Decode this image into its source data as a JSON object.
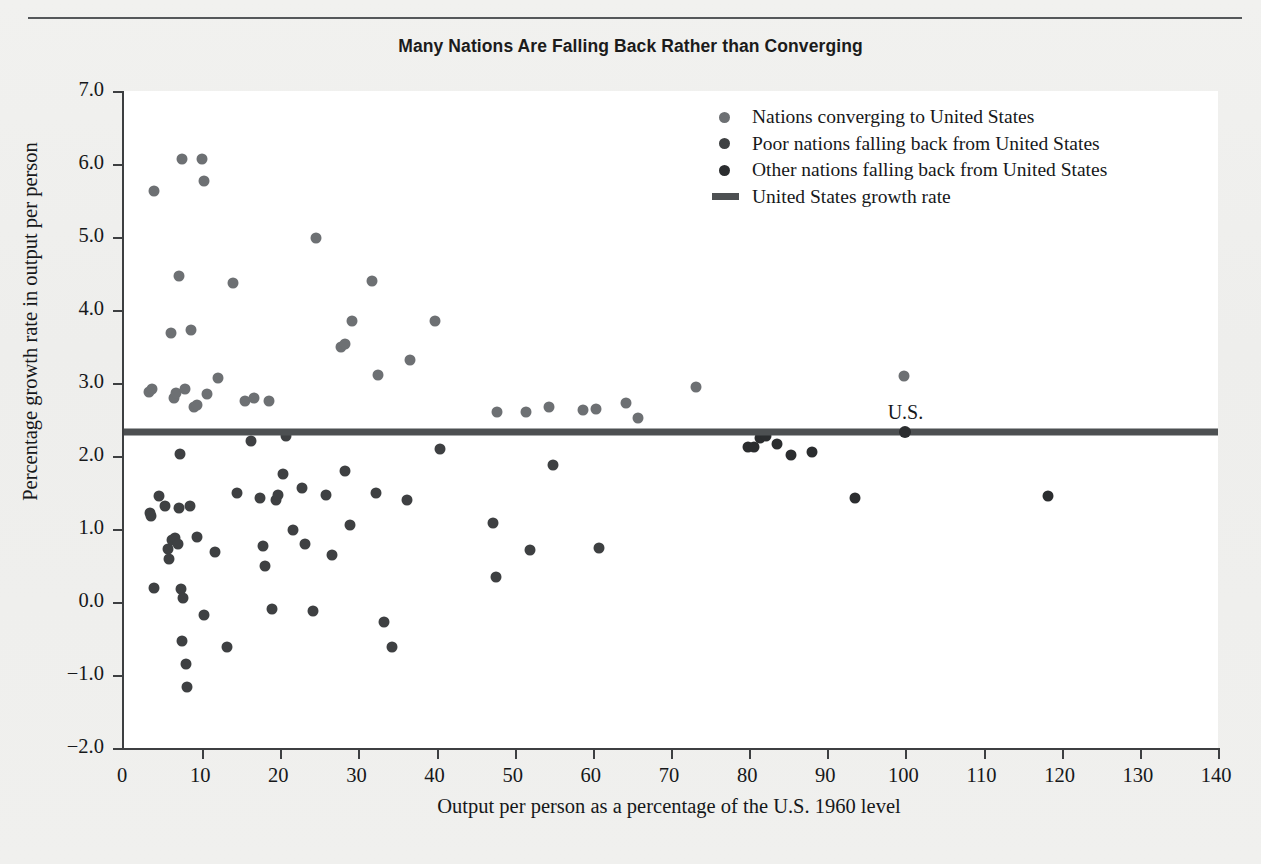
{
  "chart_data": {
    "type": "scatter",
    "title": "Many Nations Are Falling Back Rather than Converging",
    "xlabel": "Output per person as a percentage of the U.S. 1960 level",
    "ylabel": "Percentage growth rate in output per person",
    "xlim": [
      0,
      140
    ],
    "ylim": [
      -2.0,
      7.0
    ],
    "xticks": [
      0,
      10,
      20,
      30,
      40,
      50,
      60,
      70,
      80,
      90,
      100,
      110,
      120,
      130,
      140
    ],
    "xtick_labels": [
      "0",
      "10",
      "20",
      "30",
      "40",
      "50",
      "60",
      "70",
      "80",
      "90",
      "100",
      "110",
      "120",
      "130",
      "140"
    ],
    "yticks": [
      -2.0,
      -1.0,
      0.0,
      1.0,
      2.0,
      3.0,
      4.0,
      5.0,
      6.0,
      7.0
    ],
    "ytick_labels": [
      "−2.0",
      "−1.0",
      "0.0",
      "1.0",
      "2.0",
      "3.0",
      "4.0",
      "5.0",
      "6.0",
      "7.0"
    ],
    "grid": false,
    "legend_position": "upper right",
    "annotations": [
      {
        "text": "U.S.",
        "x": 100,
        "y": 2.32
      }
    ],
    "reference_line": {
      "name": "United States growth rate",
      "orientation": "horizontal",
      "y": 2.33,
      "color": "#4d5052",
      "width_px": 7
    },
    "series": [
      {
        "name": "Nations converging to United States",
        "color": "#6d7073",
        "marker": "circle",
        "marker_size_px": 11,
        "points": [
          [
            3.2,
            2.88
          ],
          [
            3.6,
            2.92
          ],
          [
            3.8,
            5.63
          ],
          [
            6.0,
            3.68
          ],
          [
            6.4,
            2.8
          ],
          [
            6.6,
            2.86
          ],
          [
            7.1,
            4.46
          ],
          [
            7.4,
            6.07
          ],
          [
            7.8,
            2.92
          ],
          [
            8.6,
            3.73
          ],
          [
            9.0,
            2.67
          ],
          [
            9.3,
            2.7
          ],
          [
            10.0,
            6.07
          ],
          [
            10.3,
            5.77
          ],
          [
            10.6,
            2.85
          ],
          [
            12.0,
            3.07
          ],
          [
            13.9,
            4.37
          ],
          [
            15.5,
            2.76
          ],
          [
            16.7,
            2.79
          ],
          [
            18.6,
            2.76
          ],
          [
            24.6,
            4.98
          ],
          [
            27.8,
            3.5
          ],
          [
            28.3,
            3.54
          ],
          [
            29.2,
            3.85
          ],
          [
            31.8,
            4.4
          ],
          [
            32.5,
            3.11
          ],
          [
            36.6,
            3.31
          ],
          [
            39.8,
            3.85
          ],
          [
            47.7,
            2.6
          ],
          [
            51.5,
            2.6
          ],
          [
            54.4,
            2.67
          ],
          [
            58.7,
            2.63
          ],
          [
            60.4,
            2.65
          ],
          [
            64.3,
            2.73
          ],
          [
            65.8,
            2.52
          ],
          [
            73.2,
            2.95
          ],
          [
            99.8,
            3.09
          ]
        ]
      },
      {
        "name": "Poor nations falling back from United States",
        "color": "#3e4042",
        "marker": "circle",
        "marker_size_px": 11,
        "points": [
          [
            3.3,
            1.22
          ],
          [
            3.5,
            1.18
          ],
          [
            3.8,
            0.19
          ],
          [
            4.5,
            1.45
          ],
          [
            5.3,
            1.32
          ],
          [
            5.6,
            0.73
          ],
          [
            5.8,
            0.59
          ],
          [
            6.2,
            0.85
          ],
          [
            6.5,
            0.87
          ],
          [
            6.9,
            0.79
          ],
          [
            7.0,
            1.29
          ],
          [
            7.2,
            2.03
          ],
          [
            7.3,
            0.18
          ],
          [
            7.4,
            -0.54
          ],
          [
            7.6,
            0.05
          ],
          [
            7.9,
            -0.85
          ],
          [
            8.1,
            -1.17
          ],
          [
            8.4,
            1.32
          ],
          [
            9.4,
            0.89
          ],
          [
            10.3,
            -0.18
          ],
          [
            11.6,
            0.68
          ],
          [
            13.2,
            -0.61
          ],
          [
            14.5,
            1.49
          ],
          [
            16.3,
            2.21
          ],
          [
            17.4,
            1.42
          ],
          [
            17.8,
            0.77
          ],
          [
            18.0,
            0.5
          ],
          [
            18.9,
            -0.09
          ],
          [
            19.4,
            1.4
          ],
          [
            19.7,
            1.47
          ],
          [
            20.4,
            1.75
          ],
          [
            20.7,
            2.27
          ],
          [
            21.6,
            0.99
          ],
          [
            22.8,
            1.56
          ],
          [
            23.1,
            0.8
          ],
          [
            24.2,
            -0.12
          ],
          [
            25.8,
            1.47
          ],
          [
            26.6,
            0.65
          ],
          [
            28.3,
            1.79
          ],
          [
            28.9,
            1.05
          ],
          [
            32.2,
            1.5
          ],
          [
            33.3,
            -0.27
          ],
          [
            34.3,
            -0.61
          ],
          [
            36.2,
            1.4
          ],
          [
            40.4,
            2.09
          ],
          [
            47.2,
            1.08
          ],
          [
            47.6,
            0.34
          ],
          [
            51.9,
            0.71
          ],
          [
            54.9,
            1.87
          ],
          [
            60.8,
            0.74
          ]
        ]
      },
      {
        "name": "Other nations falling back from United States",
        "color": "#2b2d2f",
        "marker": "circle",
        "marker_size_px": 11,
        "points": [
          [
            79.8,
            2.13
          ],
          [
            80.6,
            2.12
          ],
          [
            81.4,
            2.25
          ],
          [
            82.1,
            2.27
          ],
          [
            83.6,
            2.16
          ],
          [
            85.3,
            2.02
          ],
          [
            88.1,
            2.06
          ],
          [
            93.5,
            1.43
          ],
          [
            118.2,
            1.45
          ]
        ]
      }
    ]
  },
  "legend": {
    "items": [
      {
        "label": "Nations converging to United States",
        "type": "dot",
        "color": "#6d7073"
      },
      {
        "label": "Poor nations falling back from United States",
        "type": "dot",
        "color": "#3e4042"
      },
      {
        "label": "Other nations falling back from United States",
        "type": "dot",
        "color": "#2b2d2f"
      },
      {
        "label": "United States growth rate",
        "type": "line",
        "color": "#4d5052"
      }
    ]
  }
}
